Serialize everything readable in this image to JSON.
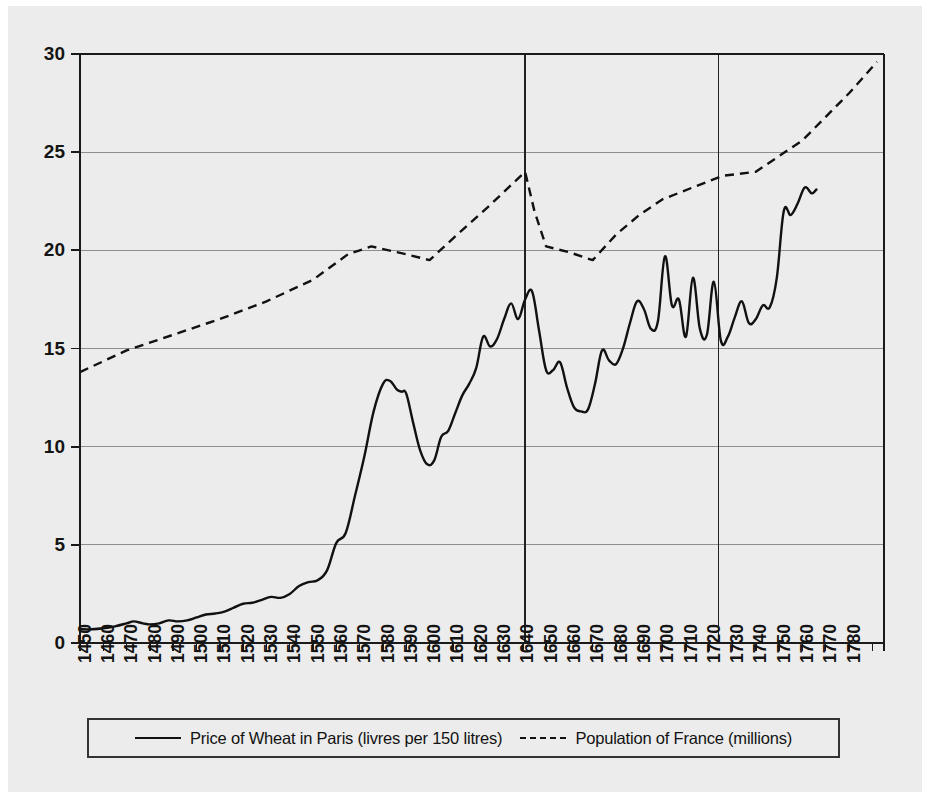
{
  "figure": {
    "background_color": "#ececec",
    "page_color": "#ffffff",
    "ink_color": "#111111",
    "grid_color": "#8e8e8e"
  },
  "legend": {
    "position": "bottom",
    "entries": [
      {
        "label": "Price of Wheat in Paris (livres per 150 litres)",
        "style": "solid",
        "icon": "solid-line-swatch"
      },
      {
        "label": "Population of France (millions)",
        "style": "dashed",
        "icon": "dashed-line-swatch"
      }
    ]
  },
  "chart_data": {
    "type": "line",
    "title": "",
    "subtitle": "",
    "xlabel": "",
    "ylabel": "",
    "xlim": [
      1450,
      1795
    ],
    "ylim": [
      0,
      30
    ],
    "grid": true,
    "legend_position": "bottom",
    "y_ticks": [
      0,
      5,
      10,
      15,
      20,
      25,
      30
    ],
    "x_ticks": [
      1450,
      1460,
      1470,
      1480,
      1490,
      1500,
      1510,
      1520,
      1530,
      1540,
      1550,
      1560,
      1570,
      1580,
      1590,
      1600,
      1610,
      1620,
      1630,
      1640,
      1650,
      1660,
      1670,
      1680,
      1690,
      1700,
      1710,
      1720,
      1730,
      1740,
      1750,
      1760,
      1770,
      1780
    ],
    "x_tick_labels": [
      "1450",
      "1460",
      "1470",
      "1480",
      "1490",
      "1500",
      "1510",
      "1520",
      "1530",
      "1540",
      "1550",
      "1560",
      "1570",
      "1580",
      "1590",
      "1600",
      "1610",
      "1620",
      "1630",
      "1640",
      "1650",
      "1660",
      "1670",
      "1680",
      "1690",
      "1700",
      "1710",
      "1720",
      "1730",
      "1740",
      "1750",
      "1760",
      "1770",
      "1780"
    ],
    "x_minor_ticks_unlabeled": [
      1790,
      1795
    ],
    "annotations": [
      {
        "type": "vertical-reference-line",
        "x": 1641,
        "label": ""
      },
      {
        "type": "vertical-reference-line",
        "x": 1724,
        "label": ""
      }
    ],
    "series": [
      {
        "name": "Price of Wheat in Paris (livres per 150 litres)",
        "style": "solid",
        "units": "livres per 150 litres",
        "x": [
          1450,
          1455,
          1460,
          1465,
          1470,
          1473,
          1477,
          1480,
          1484,
          1488,
          1492,
          1496,
          1500,
          1504,
          1508,
          1512,
          1516,
          1520,
          1524,
          1528,
          1532,
          1536,
          1540,
          1544,
          1548,
          1552,
          1556,
          1560,
          1564,
          1568,
          1572,
          1576,
          1580,
          1583,
          1586,
          1588,
          1590,
          1593,
          1596,
          1599,
          1602,
          1605,
          1608,
          1611,
          1614,
          1617,
          1620,
          1623,
          1626,
          1629,
          1632,
          1635,
          1638,
          1641,
          1644,
          1647,
          1650,
          1653,
          1656,
          1659,
          1662,
          1665,
          1668,
          1671,
          1674,
          1677,
          1680,
          1683,
          1686,
          1689,
          1692,
          1695,
          1698,
          1701,
          1704,
          1707,
          1710,
          1713,
          1716,
          1719,
          1722,
          1725,
          1728,
          1731,
          1734,
          1737,
          1740,
          1743,
          1746,
          1749,
          1752,
          1755,
          1758,
          1761,
          1764,
          1766
        ],
        "y": [
          0.7,
          0.7,
          0.75,
          0.85,
          1.0,
          1.1,
          1.0,
          0.95,
          1.0,
          1.15,
          1.1,
          1.15,
          1.3,
          1.45,
          1.5,
          1.6,
          1.8,
          2.0,
          2.05,
          2.2,
          2.35,
          2.3,
          2.5,
          2.9,
          3.1,
          3.2,
          3.7,
          5.1,
          5.6,
          7.5,
          9.5,
          11.8,
          13.2,
          13.35,
          12.9,
          12.8,
          12.7,
          11.2,
          9.8,
          9.1,
          9.3,
          10.5,
          10.8,
          11.7,
          12.6,
          13.2,
          14.0,
          15.6,
          15.1,
          15.5,
          16.5,
          17.3,
          16.5,
          17.5,
          17.9,
          15.9,
          13.9,
          13.9,
          14.3,
          13.0,
          12.0,
          11.8,
          11.9,
          13.2,
          14.9,
          14.4,
          14.2,
          15.0,
          16.3,
          17.4,
          17.0,
          16.0,
          16.4,
          19.7,
          17.2,
          17.5,
          15.6,
          18.6,
          16.0,
          15.7,
          18.4,
          15.4,
          15.6,
          16.6,
          17.4,
          16.3,
          16.5,
          17.2,
          17.1,
          18.6,
          22.0,
          21.8,
          22.4,
          23.2,
          22.9,
          23.1
        ]
      },
      {
        "name": "Population of France (millions)",
        "style": "dashed",
        "units": "millions",
        "x": [
          1450,
          1470,
          1490,
          1510,
          1530,
          1550,
          1565,
          1575,
          1590,
          1600,
          1610,
          1625,
          1641,
          1645,
          1650,
          1660,
          1670,
          1680,
          1690,
          1700,
          1715,
          1726,
          1740,
          1750,
          1760,
          1770,
          1780,
          1792
        ],
        "y": [
          13.8,
          14.9,
          15.7,
          16.5,
          17.4,
          18.5,
          19.8,
          20.2,
          19.8,
          19.5,
          20.6,
          22.2,
          24.0,
          22.0,
          20.2,
          19.9,
          19.5,
          20.8,
          21.8,
          22.6,
          23.3,
          23.8,
          24.0,
          24.8,
          25.6,
          26.8,
          28.0,
          29.6
        ]
      }
    ]
  }
}
